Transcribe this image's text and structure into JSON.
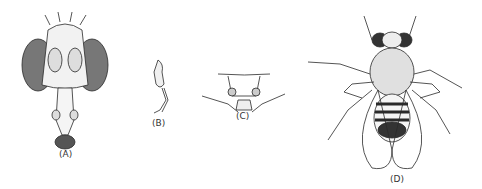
{
  "figure": {
    "panels": [
      {
        "id": "A",
        "label": "(A)",
        "subject": "fly head, frontal view"
      },
      {
        "id": "B",
        "label": "(B)",
        "subject": "antenna"
      },
      {
        "id": "C",
        "label": "(C)",
        "subject": "mouthparts / proboscis base"
      },
      {
        "id": "D",
        "label": "(D)",
        "subject": "whole adult fly, dorsal view"
      }
    ],
    "colors": {
      "ink": "#2a2a2a",
      "background": "#ffffff"
    }
  }
}
